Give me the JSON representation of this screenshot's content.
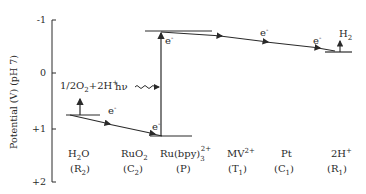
{
  "axis": {
    "label": "Potential (V) (pH 7)",
    "ticks": [
      "-1",
      "0",
      "+1",
      "+2"
    ]
  },
  "levels": {
    "oxygen_reaction": {
      "main": "1/2O",
      "sub": "2",
      "rest": "+2H",
      "sup": "+"
    },
    "photon": "hν",
    "hydrogen": {
      "main": "H",
      "sub": "2"
    },
    "electron": "e",
    "electron_sup": "-"
  },
  "species": [
    {
      "name": "H2O",
      "main": "H",
      "sub": "2",
      "rest": "O",
      "code": "(R",
      "code_sub": "2",
      "code_end": ")"
    },
    {
      "name": "RuO2",
      "main": "RuO",
      "sub": "2",
      "rest": "",
      "code": "(C",
      "code_sub": "2",
      "code_end": ")"
    },
    {
      "name": "Ru(bpy)3 2+",
      "main": "Ru(bpy)",
      "sub": "3",
      "sup": "2+",
      "code": "(P)"
    },
    {
      "name": "MV2+",
      "main": "MV",
      "sup": "2+",
      "code": "(T",
      "code_sub": "1",
      "code_end": ")"
    },
    {
      "name": "Pt",
      "main": "Pt",
      "code": "(C",
      "code_sub": "1",
      "code_end": ")"
    },
    {
      "name": "2H+",
      "main": "2H",
      "sup": "+",
      "code": "(R",
      "code_sub": "1",
      "code_end": ")"
    }
  ],
  "colors": {
    "ink": "#2a2a2a",
    "background": "#ffffff"
  }
}
